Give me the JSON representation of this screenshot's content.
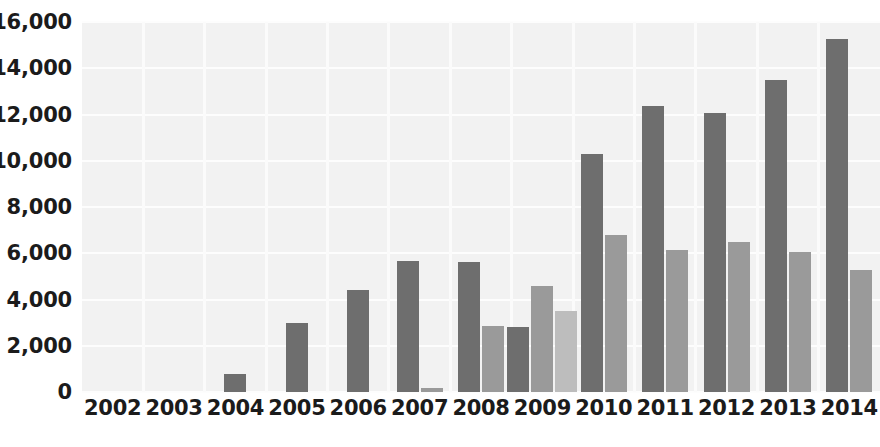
{
  "chart_data": {
    "type": "bar",
    "title": "",
    "subtitle": "",
    "xlabel": "",
    "ylabel": "",
    "grid": true,
    "legend_position": "none",
    "ylim": [
      0,
      16000
    ],
    "yticks": [
      0,
      2000,
      4000,
      6000,
      8000,
      10000,
      12000,
      14000,
      16000
    ],
    "ytick_labels": [
      "0",
      "2,000",
      "4,000",
      "6,000",
      "8,000",
      "10,000",
      "12,000",
      "14,000",
      "16,000"
    ],
    "categories": [
      "2002",
      "2003",
      "2004",
      "2005",
      "2006",
      "2007",
      "2008",
      "2009",
      "2010",
      "2011",
      "2012",
      "2013",
      "2014"
    ],
    "series": [
      {
        "name": "Series 1",
        "color": "#6e6e6e",
        "values": [
          0,
          0,
          760,
          2980,
          4400,
          5680,
          5620,
          2820,
          10300,
          12350,
          12050,
          13480,
          15280
        ]
      },
      {
        "name": "Series 2",
        "color": "#9a9a9a",
        "values": [
          0,
          0,
          0,
          0,
          0,
          180,
          2860,
          4600,
          6780,
          6150,
          6500,
          6040,
          5280
        ]
      },
      {
        "name": "Series 3",
        "color": "#bdbdbd",
        "values": [
          0,
          0,
          0,
          0,
          0,
          0,
          0,
          3500,
          0,
          0,
          0,
          0,
          0
        ]
      }
    ]
  },
  "colors": {
    "plot_background": "#f2f2f2",
    "page_background": "#ffffff",
    "gridline": "#fdfdfd",
    "tick_label": "#1b1b1b",
    "series_1": "#6e6e6e",
    "series_2": "#9a9a9a",
    "series_3": "#bdbdbd"
  }
}
